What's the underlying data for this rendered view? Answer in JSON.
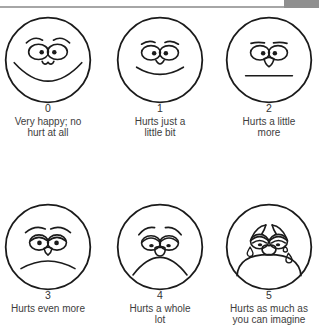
{
  "header": {
    "rule_color": "#a6a6a6",
    "corner_block_color": "#8f8f8f"
  },
  "scale": {
    "ink_color": "#1b1b1b",
    "text_color": "#3d3d3d",
    "faces": [
      {
        "number": "0",
        "caption": "Very happy; no\nhurt at all",
        "expression": "very-happy-big-smile"
      },
      {
        "number": "1",
        "caption": "Hurts just a\nlittle bit",
        "expression": "small-smile"
      },
      {
        "number": "2",
        "caption": "Hurts a little\nmore",
        "expression": "neutral-straight-mouth"
      },
      {
        "number": "3",
        "caption": "Hurts even more",
        "expression": "slight-frown"
      },
      {
        "number": "4",
        "caption": "Hurts a whole\nlot",
        "expression": "deep-frown"
      },
      {
        "number": "5",
        "caption": "Hurts as much as\nyou can imagine",
        "expression": "crying-with-tears"
      }
    ]
  }
}
